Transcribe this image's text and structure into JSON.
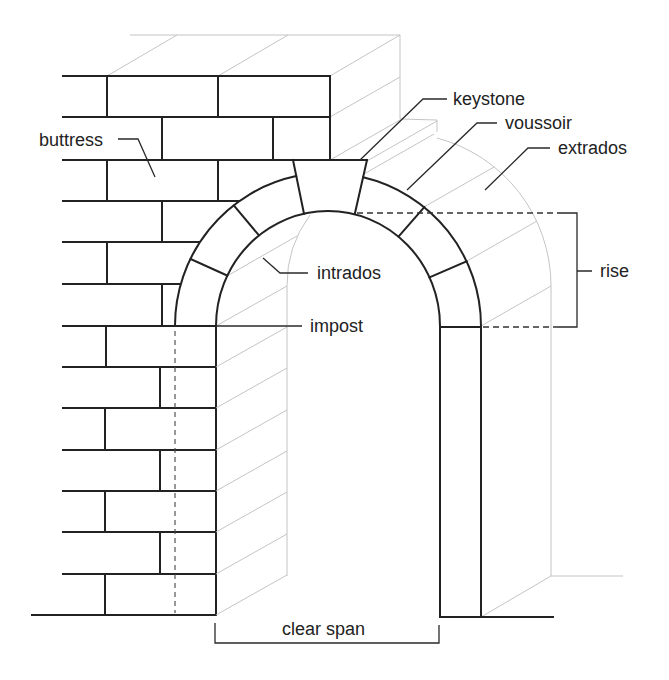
{
  "diagram": {
    "labels": {
      "buttress": "buttress",
      "keystone": "keystone",
      "voussoir": "voussoir",
      "extrados": "extrados",
      "intrados": "intrados",
      "impost": "impost",
      "rise": "rise",
      "clear_span": "clear span"
    },
    "colors": {
      "line": "#222222",
      "hidden_line": "#bdbdbd",
      "background": "#ffffff"
    }
  }
}
